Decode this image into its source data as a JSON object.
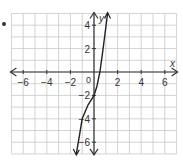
{
  "chart_data": {
    "type": "line",
    "title": "",
    "xlabel": "x",
    "ylabel": "y",
    "xlim": [
      -7,
      7
    ],
    "ylim": [
      -7,
      5
    ],
    "grid": true,
    "x_ticks": [
      -6,
      -4,
      -2,
      2,
      4,
      6
    ],
    "y_ticks": [
      4,
      2,
      -2,
      -4,
      -6
    ],
    "origin_label": "0",
    "series": [
      {
        "name": "curve",
        "x": [
          -1.5,
          -1.25,
          -1.0,
          -0.5,
          0.0,
          0.25,
          0.5,
          0.75,
          1.0,
          1.15
        ],
        "y": [
          -7.0,
          -5.5,
          -4.0,
          -2.8,
          -2.0,
          -1.2,
          0.0,
          1.8,
          3.8,
          5.0
        ]
      }
    ]
  },
  "labels": {
    "x_axis": "x",
    "y_axis": "y",
    "origin": "0",
    "x_tick_labels": [
      "−6",
      "−4",
      "−2",
      "2",
      "4",
      "6"
    ],
    "y_tick_labels": [
      "4",
      "2",
      "−2",
      "−4",
      "−6"
    ]
  },
  "colors": {
    "grid": "#c8c8c8",
    "axis": "#333333",
    "curve": "#222222",
    "text": "#333333"
  }
}
